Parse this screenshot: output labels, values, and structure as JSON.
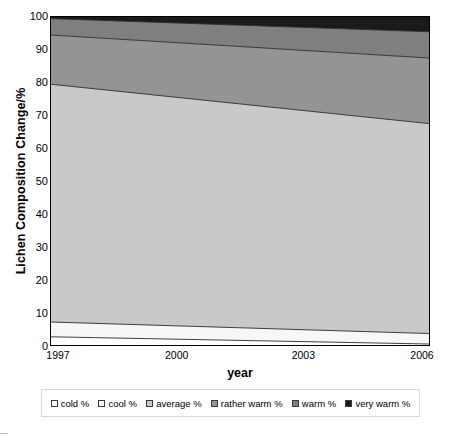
{
  "chart_data": {
    "type": "area",
    "stacked": true,
    "title": "",
    "xlabel": "year",
    "ylabel": "Lichen Composition Change/%",
    "x": [
      1997,
      2006
    ],
    "x_tick_labels": [
      "1997",
      "2000",
      "2003",
      "2006"
    ],
    "x_tick_values": [
      1997,
      2000,
      2003,
      2006
    ],
    "xlim": [
      1997,
      2006
    ],
    "ylim": [
      0,
      100
    ],
    "y_tick_labels": [
      "0",
      "10",
      "20",
      "30",
      "40",
      "50",
      "60",
      "70",
      "80",
      "90",
      "100"
    ],
    "y_tick_values": [
      0,
      10,
      20,
      30,
      40,
      50,
      60,
      70,
      80,
      90,
      100
    ],
    "grid": false,
    "legend_position": "bottom",
    "series": [
      {
        "name": "cold %",
        "color": "#ffffff",
        "values": [
          2.5,
          0.3
        ],
        "cumulative_top": [
          2.5,
          0.3
        ]
      },
      {
        "name": "cool %",
        "color": "#f7f7f7",
        "values": [
          4.5,
          3.2
        ],
        "cumulative_top": [
          7.0,
          3.5
        ]
      },
      {
        "name": "average %",
        "color": "#c9c9c9",
        "values": [
          72.5,
          64.0
        ],
        "cumulative_top": [
          79.5,
          67.5
        ]
      },
      {
        "name": "rather warm %",
        "color": "#949494",
        "values": [
          15.0,
          20.0
        ],
        "cumulative_top": [
          94.5,
          87.5
        ]
      },
      {
        "name": "warm %",
        "color": "#7f7f7f",
        "values": [
          5.0,
          8.0
        ],
        "cumulative_top": [
          99.5,
          95.5
        ]
      },
      {
        "name": "very warm %",
        "color": "#1a1a1a",
        "values": [
          0.5,
          4.5
        ],
        "cumulative_top": [
          100.0,
          100.0
        ]
      }
    ]
  },
  "legend": {
    "items": [
      {
        "label": "cold %"
      },
      {
        "label": "cool %"
      },
      {
        "label": "average %"
      },
      {
        "label": "rather warm %"
      },
      {
        "label": "warm %"
      },
      {
        "label": "very warm %"
      }
    ]
  }
}
